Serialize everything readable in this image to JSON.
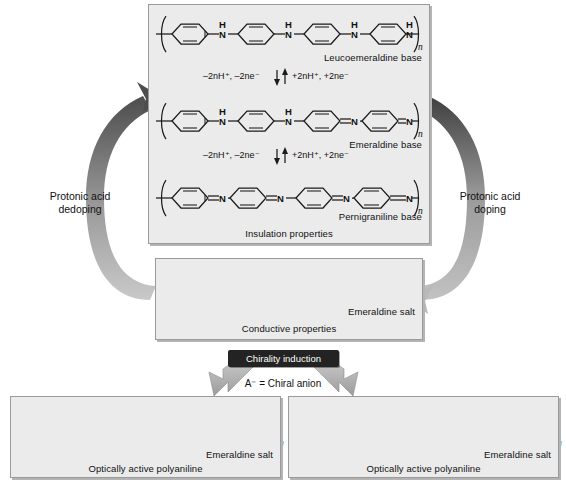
{
  "panels": {
    "bases": {
      "footer": "Insulation properties",
      "rows": [
        {
          "label": "Leucoemeraldine base",
          "form": "fully-reduced",
          "repeat_unit": "n"
        },
        {
          "label": "Emeraldine base",
          "form": "half-oxidized",
          "repeat_unit": "n"
        },
        {
          "label": "Pernigraniline base",
          "form": "fully-oxidized",
          "repeat_unit": "n"
        }
      ],
      "redox_steps": [
        {
          "left": "–2nH⁺, –2ne⁻",
          "right": "+2nH⁺, +2ne⁻"
        },
        {
          "left": "–2nH⁺, –2ne⁻",
          "right": "+2nH⁺, +2ne⁻"
        }
      ]
    },
    "salt": {
      "label": "Emeraldine salt",
      "footer": "Conductive properties",
      "counter_ion": "A⁻",
      "repeat_unit": "n"
    },
    "optically_active_left": {
      "label": "Emeraldine salt",
      "footer": "Optically active polyaniline",
      "counter_ion": "(+)-A⁻",
      "repeat_unit": "n"
    },
    "optically_active_right": {
      "label": "Emeraldine salt",
      "footer": "Optically active polyaniline",
      "counter_ion": "(−)-A⁻",
      "repeat_unit": "n"
    }
  },
  "arrows": {
    "left_label_line1": "Protonic acid",
    "left_label_line2": "dedoping",
    "right_label_line1": "Protonic acid",
    "right_label_line2": "doping"
  },
  "chirality": {
    "chip_label": "Chirality induction",
    "note": "A⁻ = Chiral anion"
  },
  "colors": {
    "panel_fill": "#ebebeb",
    "panel_border": "#9a9a9a",
    "chip_background": "#232323",
    "chip_text": "#ffffff",
    "arrow_dark": "#595959",
    "arrow_light": "#a8a8a8",
    "bond": "#1b1b1b",
    "page_background": "#ffffff"
  }
}
